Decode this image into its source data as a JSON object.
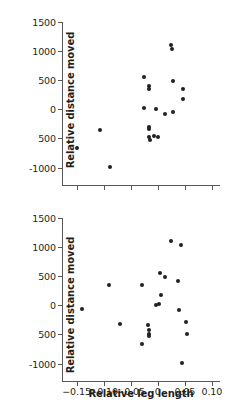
{
  "figure": {
    "background": "#ffffff",
    "marker_color": "#231f20",
    "axis_color": "#58585a"
  },
  "chart_data": [
    {
      "type": "scatter",
      "panel": "top",
      "title": "",
      "xlabel": "",
      "ylabel": "Relative distance moved",
      "xlim": [
        -0.175,
        0.115
      ],
      "ylim": [
        -1300,
        1500
      ],
      "xticks": [
        -0.15,
        -0.1,
        -0.05,
        0,
        0.05,
        0.1
      ],
      "xticklabels": [
        "",
        "",
        "",
        "",
        "",
        ""
      ],
      "yticks": [
        -1000,
        -500,
        0,
        500,
        1000,
        1500
      ],
      "yticklabels": [
        "-1000",
        "500",
        "0",
        "500",
        "1000",
        "1500"
      ],
      "grid": false,
      "legend": false,
      "points": [
        {
          "x": -0.149,
          "y": -660
        },
        {
          "x": -0.106,
          "y": -350
        },
        {
          "x": -0.088,
          "y": -990
        },
        {
          "x": -0.026,
          "y": 560
        },
        {
          "x": -0.026,
          "y": 30
        },
        {
          "x": -0.016,
          "y": 405
        },
        {
          "x": -0.016,
          "y": 350
        },
        {
          "x": -0.017,
          "y": -300
        },
        {
          "x": -0.017,
          "y": -330
        },
        {
          "x": -0.016,
          "y": -470
        },
        {
          "x": -0.015,
          "y": -520
        },
        {
          "x": -0.007,
          "y": -455
        },
        {
          "x": -0.003,
          "y": 0
        },
        {
          "x": 0.001,
          "y": -475
        },
        {
          "x": 0.013,
          "y": -80
        },
        {
          "x": 0.025,
          "y": 1105
        },
        {
          "x": 0.026,
          "y": 1040
        },
        {
          "x": 0.028,
          "y": 490
        },
        {
          "x": 0.029,
          "y": -50
        },
        {
          "x": 0.046,
          "y": 350
        },
        {
          "x": 0.046,
          "y": 170
        }
      ]
    },
    {
      "type": "scatter",
      "panel": "bottom",
      "title": "",
      "xlabel": "Relative leg length",
      "ylabel": "Relative distance moved",
      "xlim": [
        -0.175,
        0.115
      ],
      "ylim": [
        -1300,
        1500
      ],
      "xticks": [
        -0.15,
        -0.1,
        -0.05,
        0,
        0.05,
        0.1
      ],
      "xticklabels": [
        "−0.15",
        "−0.10",
        "−0.05",
        "0",
        "0.05",
        "0.10"
      ],
      "yticks": [
        -1000,
        -500,
        0,
        500,
        1000,
        1500
      ],
      "yticklabels": [
        "-1000",
        "500",
        "0",
        "500",
        "1000",
        "1500"
      ],
      "grid": false,
      "legend": false,
      "points": [
        {
          "x": -0.139,
          "y": -60
        },
        {
          "x": -0.09,
          "y": 345
        },
        {
          "x": -0.07,
          "y": -315
        },
        {
          "x": -0.029,
          "y": 345
        },
        {
          "x": -0.03,
          "y": -660
        },
        {
          "x": -0.018,
          "y": -330
        },
        {
          "x": -0.017,
          "y": -430
        },
        {
          "x": -0.017,
          "y": -490
        },
        {
          "x": -0.016,
          "y": -525
        },
        {
          "x": -0.003,
          "y": 0
        },
        {
          "x": 0.002,
          "y": 20
        },
        {
          "x": 0.004,
          "y": 560
        },
        {
          "x": 0.006,
          "y": 170
        },
        {
          "x": 0.014,
          "y": 490
        },
        {
          "x": 0.025,
          "y": 1105
        },
        {
          "x": 0.038,
          "y": 410
        },
        {
          "x": 0.039,
          "y": -80
        },
        {
          "x": 0.043,
          "y": 1040
        },
        {
          "x": 0.044,
          "y": -990
        },
        {
          "x": 0.053,
          "y": -290
        },
        {
          "x": 0.054,
          "y": -485
        }
      ]
    }
  ]
}
